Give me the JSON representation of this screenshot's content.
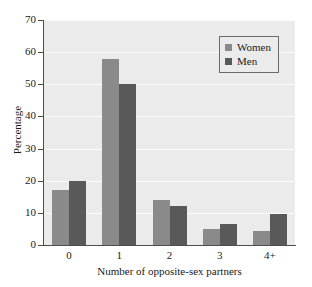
{
  "chart_data": {
    "type": "bar",
    "title": "",
    "xlabel": "Number of opposite-sex partners",
    "ylabel": "Percentage",
    "categories": [
      "0",
      "1",
      "2",
      "3",
      "4+"
    ],
    "series": [
      {
        "name": "Women",
        "color": "#8a8a8a",
        "values": [
          17,
          58,
          14,
          5,
          4.5
        ]
      },
      {
        "name": "Men",
        "color": "#595959",
        "values": [
          20,
          50,
          12,
          6.5,
          9.5
        ]
      }
    ],
    "ylim": [
      0,
      70
    ],
    "yticks": [
      "0",
      "10",
      "20",
      "30",
      "40",
      "50",
      "60",
      "70"
    ],
    "ytick_values": [
      0,
      10,
      20,
      30,
      40,
      50,
      60,
      70
    ],
    "grid": "horizontal",
    "legend_position": "top-right",
    "plot_background": "#ebebeb",
    "gridline_color": "#fbfbfb",
    "axis_color": "#4d4d4d"
  }
}
